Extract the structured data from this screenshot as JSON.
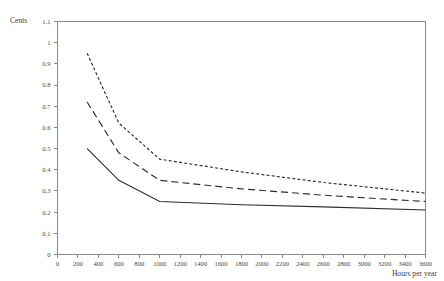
{
  "chart_data": {
    "type": "line",
    "title": "",
    "subtitle": "",
    "xlabel": "Hours per year",
    "ylabel": "Cents",
    "xlim": [
      0,
      3600
    ],
    "ylim": [
      0,
      1.1
    ],
    "grid": false,
    "legend": "none",
    "xticks": [
      0,
      200,
      400,
      600,
      800,
      1000,
      1200,
      1400,
      1600,
      1800,
      2000,
      2200,
      2400,
      2600,
      2800,
      3000,
      3200,
      3400,
      3600
    ],
    "xtick_labels": [
      "0",
      "200",
      "400",
      "600",
      "800",
      "1000",
      "1200",
      "1400",
      "1600",
      "1800",
      "2000",
      "2200",
      "2400",
      "2600",
      "2800",
      "3000",
      "3200",
      "3400",
      "3600"
    ],
    "yticks": [
      0,
      0.1,
      0.2,
      0.3,
      0.4,
      0.5,
      0.6,
      0.7,
      0.8,
      0.9,
      1,
      1.1
    ],
    "ytick_labels": [
      "0",
      "0.1",
      "0.2",
      "0.3",
      "0.4",
      "0.5",
      "0.6",
      "0.7",
      "0.8",
      "0.9",
      "1",
      "1.1"
    ],
    "series": [
      {
        "name": "upper-curve",
        "style": "dotted",
        "dasharray": "3,2.2",
        "x": [
          290,
          600,
          1000,
          1800,
          2600,
          3600
        ],
        "y": [
          0.95,
          0.62,
          0.45,
          0.39,
          0.34,
          0.29
        ]
      },
      {
        "name": "middle-curve",
        "style": "dashed",
        "dasharray": "7,4",
        "x": [
          290,
          600,
          1000,
          1800,
          2600,
          3600
        ],
        "y": [
          0.72,
          0.48,
          0.35,
          0.31,
          0.28,
          0.25
        ]
      },
      {
        "name": "lower-curve",
        "style": "solid",
        "dasharray": "",
        "x": [
          290,
          600,
          1000,
          1800,
          2600,
          3600
        ],
        "y": [
          0.5,
          0.35,
          0.25,
          0.235,
          0.225,
          0.21
        ]
      }
    ]
  },
  "axes": {
    "y_title": "Cents",
    "x_title": "Hours per year"
  }
}
